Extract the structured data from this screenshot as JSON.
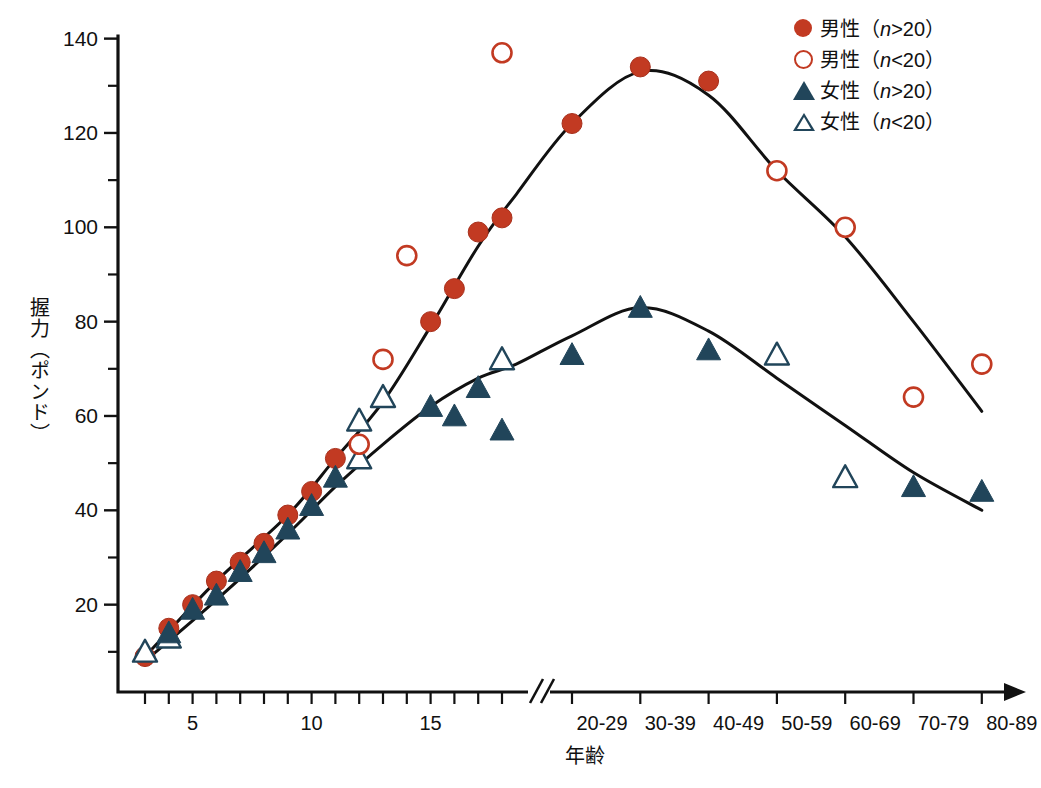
{
  "chart_data": {
    "type": "scatter",
    "title": "",
    "xlabel": "年齢",
    "ylabel": "握力（ポンド）",
    "ylim": [
      0,
      140
    ],
    "yticks_major": [
      20,
      40,
      60,
      80,
      100,
      120,
      140
    ],
    "yticks_minor": [
      10,
      30,
      50,
      70,
      90,
      110,
      130
    ],
    "xticks_years": [
      3,
      4,
      5,
      6,
      7,
      8,
      9,
      10,
      11,
      12,
      13,
      14,
      15,
      16,
      17,
      18,
      19
    ],
    "xtick_labels_years": [
      "5",
      "10",
      "15"
    ],
    "xtick_labeled_years": [
      5,
      10,
      15
    ],
    "xticks_decades": [
      "20-29",
      "30-39",
      "40-49",
      "50-59",
      "60-69",
      "70-79",
      "80-89"
    ],
    "axis_break": true,
    "grid": false,
    "legend_position": "top-right",
    "colors": {
      "male": "#c23a22",
      "female": "#21455a",
      "axis": "#111111",
      "background": "#ffffff"
    },
    "series": [
      {
        "name": "男性 (n>20)",
        "sex": "male",
        "sample": "n>20",
        "marker": "filled-circle",
        "color": "#c23a22",
        "points": [
          {
            "x": 3,
            "y": 9
          },
          {
            "x": 4,
            "y": 15
          },
          {
            "x": 5,
            "y": 20
          },
          {
            "x": 6,
            "y": 25
          },
          {
            "x": 7,
            "y": 29
          },
          {
            "x": 8,
            "y": 33
          },
          {
            "x": 9,
            "y": 39
          },
          {
            "x": 10,
            "y": 44
          },
          {
            "x": 11,
            "y": 51
          },
          {
            "x": 15,
            "y": 80
          },
          {
            "x": 16,
            "y": 87
          },
          {
            "x": 17,
            "y": 99
          },
          {
            "x": 18,
            "y": 102
          },
          {
            "x": "20-29",
            "y": 122
          },
          {
            "x": "30-39",
            "y": 134
          },
          {
            "x": "40-49",
            "y": 131
          }
        ]
      },
      {
        "name": "男性 (n<20)",
        "sex": "male",
        "sample": "n<20",
        "marker": "open-circle",
        "color": "#c23a22",
        "points": [
          {
            "x": 12,
            "y": 54
          },
          {
            "x": 13,
            "y": 72
          },
          {
            "x": 14,
            "y": 94
          },
          {
            "x": 18,
            "y": 137
          },
          {
            "x": "50-59",
            "y": 112
          },
          {
            "x": "60-69",
            "y": 100
          },
          {
            "x": "70-79",
            "y": 64
          },
          {
            "x": "80-89",
            "y": 71
          }
        ]
      },
      {
        "name": "女性 (n>20)",
        "sex": "female",
        "sample": "n>20",
        "marker": "filled-triangle",
        "color": "#21455a",
        "points": [
          {
            "x": 4,
            "y": 14
          },
          {
            "x": 5,
            "y": 19
          },
          {
            "x": 6,
            "y": 22
          },
          {
            "x": 7,
            "y": 27
          },
          {
            "x": 8,
            "y": 31
          },
          {
            "x": 9,
            "y": 36
          },
          {
            "x": 10,
            "y": 41
          },
          {
            "x": 11,
            "y": 47
          },
          {
            "x": 15,
            "y": 62
          },
          {
            "x": 16,
            "y": 60
          },
          {
            "x": 17,
            "y": 66
          },
          {
            "x": 18,
            "y": 57
          },
          {
            "x": "20-29",
            "y": 73
          },
          {
            "x": "30-39",
            "y": 83
          },
          {
            "x": "40-49",
            "y": 74
          },
          {
            "x": "70-79",
            "y": 45
          },
          {
            "x": "80-89",
            "y": 44
          }
        ]
      },
      {
        "name": "女性 (n<20)",
        "sex": "female",
        "sample": "n<20",
        "marker": "open-triangle",
        "color": "#21455a",
        "points": [
          {
            "x": 3,
            "y": 10
          },
          {
            "x": 4,
            "y": 13
          },
          {
            "x": 12,
            "y": 51
          },
          {
            "x": 12,
            "y": 59
          },
          {
            "x": 13,
            "y": 64
          },
          {
            "x": 18,
            "y": 72
          },
          {
            "x": "50-59",
            "y": 73
          },
          {
            "x": "60-69",
            "y": 47
          }
        ]
      }
    ],
    "fit_curves": [
      {
        "name": "male-fit",
        "color": "#111111"
      },
      {
        "name": "female-fit",
        "color": "#111111"
      }
    ]
  },
  "legend": {
    "items": [
      {
        "marker": "filled-circle",
        "label": "男性（n>20）",
        "pre": "男性（",
        "ital": "n",
        "post": ">20）"
      },
      {
        "marker": "open-circle",
        "label": "男性（n<20）",
        "pre": "男性（",
        "ital": "n",
        "post": "<20）"
      },
      {
        "marker": "filled-triangle",
        "label": "女性（n>20）",
        "pre": "女性（",
        "ital": "n",
        "post": ">20）"
      },
      {
        "marker": "open-triangle",
        "label": "女性（n<20）",
        "pre": "女性（",
        "ital": "n",
        "post": "<20）"
      }
    ]
  },
  "axes": {
    "y_title": "握力（ポンド）",
    "x_title": "年齢",
    "y_labels": [
      "140",
      "120",
      "100",
      "80",
      "60",
      "40",
      "20"
    ],
    "x_labels_left": [
      "5",
      "10",
      "15"
    ],
    "x_labels_right": [
      "20-29",
      "30-39",
      "40-49",
      "50-59",
      "60-69",
      "70-79",
      "80-89"
    ]
  }
}
